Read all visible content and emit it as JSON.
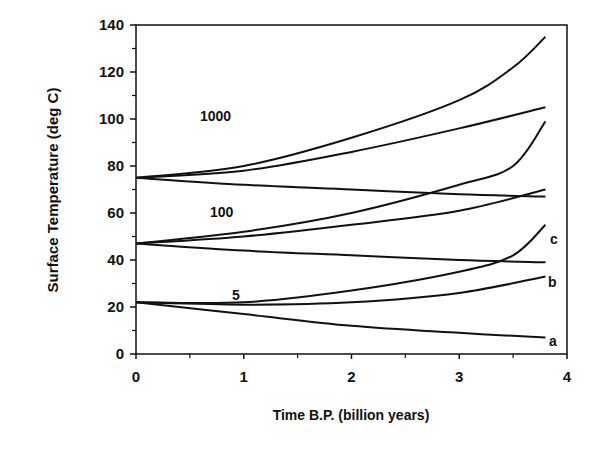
{
  "chart_data": {
    "type": "line",
    "title": "",
    "xlabel": "Time B.P. (billion years)",
    "ylabel": "Surface Temperature (deg C)",
    "xlim": [
      0,
      4
    ],
    "ylim": [
      0,
      140
    ],
    "x_ticks": [
      "0",
      "1",
      "2",
      "3",
      "4"
    ],
    "y_ticks": [
      "0",
      "20",
      "40",
      "60",
      "80",
      "100",
      "120",
      "140"
    ],
    "grid": false,
    "annotations": [
      "1000",
      "100",
      "5",
      "a",
      "b",
      "c"
    ],
    "series": [
      {
        "name": "1000 c",
        "x": [
          0,
          1,
          2,
          3,
          3.5,
          3.8
        ],
        "y": [
          75,
          80,
          92,
          108,
          122,
          135
        ]
      },
      {
        "name": "1000 b",
        "x": [
          0,
          1,
          2,
          3,
          3.8
        ],
        "y": [
          75,
          78,
          86,
          96,
          105
        ]
      },
      {
        "name": "1000 a",
        "x": [
          0,
          1,
          2,
          3,
          3.8
        ],
        "y": [
          75,
          72,
          70,
          68,
          67
        ]
      },
      {
        "name": "100 c",
        "x": [
          0,
          1,
          2,
          3,
          3.5,
          3.8
        ],
        "y": [
          47,
          52,
          60,
          72,
          80,
          99
        ]
      },
      {
        "name": "100 b",
        "x": [
          0,
          1,
          2,
          3,
          3.8
        ],
        "y": [
          47,
          50,
          55,
          61,
          70
        ]
      },
      {
        "name": "100 a",
        "x": [
          0,
          1,
          2,
          3,
          3.8
        ],
        "y": [
          47,
          44,
          42,
          40,
          39
        ]
      },
      {
        "name": "5 c",
        "x": [
          0,
          1,
          2,
          3,
          3.5,
          3.8
        ],
        "y": [
          22,
          22,
          27,
          35,
          42,
          55
        ]
      },
      {
        "name": "5 b",
        "x": [
          0,
          1,
          2,
          3,
          3.8
        ],
        "y": [
          22,
          21,
          22,
          26,
          33
        ]
      },
      {
        "name": "5 a",
        "x": [
          0,
          1,
          2,
          3,
          3.8
        ],
        "y": [
          22,
          17,
          12,
          9,
          7
        ]
      }
    ]
  },
  "labels": {
    "curve_group_1000": "1000",
    "curve_group_100": "100",
    "curve_group_5": "5",
    "curve_a": "a",
    "curve_b": "b",
    "curve_c": "c"
  }
}
